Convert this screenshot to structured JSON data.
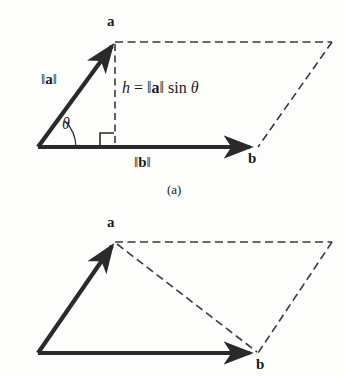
{
  "figure": {
    "background_color": "#fdfdfb",
    "stroke_color": "#2a2a2a",
    "dash_color": "#3a3a3a",
    "panels": [
      {
        "id": "panel-a",
        "caption": "(a)",
        "labels": {
          "vector_a": "a",
          "vector_b": "b",
          "norm_a_pre": "‖",
          "norm_a_mid": "a",
          "norm_a_post": "‖",
          "norm_b_pre": "‖",
          "norm_b_mid": "b",
          "norm_b_post": "‖",
          "height_expr_h": "h",
          "height_expr_eq": " = ",
          "height_expr_bar1": "‖",
          "height_expr_a": "a",
          "height_expr_bar2": "‖",
          "height_expr_sin": " sin ",
          "height_expr_theta": "θ",
          "angle_theta": "θ"
        },
        "geometry": {
          "origin": [
            38,
            147
          ],
          "a_tip": [
            115,
            42
          ],
          "b_tip": [
            255,
            147
          ],
          "parallelogram_far_corner": [
            332,
            42
          ],
          "parallelogram_b_corner": [
            258,
            147
          ],
          "foot_of_height": [
            115,
            147
          ]
        }
      },
      {
        "id": "panel-b",
        "caption": "",
        "labels": {
          "vector_a": "a",
          "vector_b": "b"
        },
        "geometry": {
          "origin": [
            38,
            353
          ],
          "a_tip": [
            115,
            242
          ],
          "b_tip": [
            255,
            353
          ],
          "parallelogram_far_corner": [
            332,
            242
          ],
          "parallelogram_b_corner": [
            258,
            353
          ]
        }
      }
    ]
  }
}
